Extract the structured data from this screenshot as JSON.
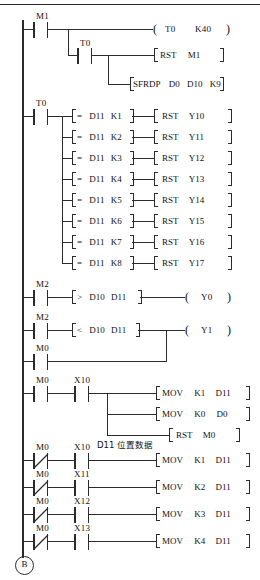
{
  "diagram": {
    "type": "plc-ladder-logic",
    "page_connector": "B",
    "comment": "D11 位置数据",
    "left_rail": true,
    "rungs": [
      {
        "id": "rung-1",
        "contacts": [
          {
            "name": "M1",
            "type": "NO"
          }
        ],
        "branches": [
          {
            "contacts": [],
            "output": {
              "kind": "coil",
              "label": "T0",
              "operand": "K40"
            }
          },
          {
            "contacts": [
              {
                "name": "T0",
                "type": "NO"
              }
            ],
            "output": {
              "kind": "box",
              "instr": "RST",
              "args": [
                "M1"
              ]
            }
          },
          {
            "contacts": [],
            "output": {
              "kind": "box",
              "instr": "SFRDP",
              "args": [
                "D0",
                "D10",
                "K9"
              ]
            }
          }
        ]
      },
      {
        "id": "rung-2",
        "contacts": [
          {
            "name": "T0",
            "type": "NO"
          }
        ],
        "branches": [
          {
            "compare": {
              "op": "=",
              "a": "D11",
              "b": "K1"
            },
            "output": {
              "kind": "box",
              "instr": "RST",
              "args": [
                "Y10"
              ]
            }
          },
          {
            "compare": {
              "op": "=",
              "a": "D11",
              "b": "K2"
            },
            "output": {
              "kind": "box",
              "instr": "RST",
              "args": [
                "Y11"
              ]
            }
          },
          {
            "compare": {
              "op": "=",
              "a": "D11",
              "b": "K3"
            },
            "output": {
              "kind": "box",
              "instr": "RST",
              "args": [
                "Y12"
              ]
            }
          },
          {
            "compare": {
              "op": "=",
              "a": "D11",
              "b": "K4"
            },
            "output": {
              "kind": "box",
              "instr": "RST",
              "args": [
                "Y13"
              ]
            }
          },
          {
            "compare": {
              "op": "=",
              "a": "D11",
              "b": "K5"
            },
            "output": {
              "kind": "box",
              "instr": "RST",
              "args": [
                "Y14"
              ]
            }
          },
          {
            "compare": {
              "op": "=",
              "a": "D11",
              "b": "K6"
            },
            "output": {
              "kind": "box",
              "instr": "RST",
              "args": [
                "Y15"
              ]
            }
          },
          {
            "compare": {
              "op": "=",
              "a": "D11",
              "b": "K7"
            },
            "output": {
              "kind": "box",
              "instr": "RST",
              "args": [
                "Y16"
              ]
            }
          },
          {
            "compare": {
              "op": "=",
              "a": "D11",
              "b": "K8"
            },
            "output": {
              "kind": "box",
              "instr": "RST",
              "args": [
                "Y17"
              ]
            }
          }
        ]
      },
      {
        "id": "rung-3",
        "contacts": [
          {
            "name": "M2",
            "type": "NO"
          }
        ],
        "compare": {
          "op": ">",
          "a": "D10",
          "b": "D11"
        },
        "output": {
          "kind": "coil",
          "label": "Y0",
          "operand": ""
        }
      },
      {
        "id": "rung-4",
        "contacts": [
          {
            "name": "M2",
            "type": "NO"
          }
        ],
        "compare": {
          "op": "<",
          "a": "D10",
          "b": "D11"
        },
        "output": {
          "kind": "coil",
          "label": "Y1",
          "operand": ""
        },
        "parallel": {
          "contacts": [
            {
              "name": "M0",
              "type": "NO"
            }
          ]
        }
      },
      {
        "id": "rung-5",
        "contacts": [
          {
            "name": "M0",
            "type": "NO"
          },
          {
            "name": "X10",
            "type": "NO"
          }
        ],
        "branches": [
          {
            "output": {
              "kind": "box",
              "instr": "MOV",
              "args": [
                "K1",
                "D11"
              ]
            }
          },
          {
            "output": {
              "kind": "box",
              "instr": "MOV",
              "args": [
                "K0",
                "D0"
              ]
            }
          },
          {
            "output": {
              "kind": "box",
              "instr": "RST",
              "args": [
                "M0"
              ]
            }
          }
        ]
      },
      {
        "id": "rung-6",
        "contacts": [
          {
            "name": "M0",
            "type": "NC"
          },
          {
            "name": "X10",
            "type": "NO"
          }
        ],
        "output": {
          "kind": "box",
          "instr": "MOV",
          "args": [
            "K1",
            "D11"
          ]
        }
      },
      {
        "id": "rung-7",
        "contacts": [
          {
            "name": "M0",
            "type": "NC"
          },
          {
            "name": "X11",
            "type": "NO"
          }
        ],
        "output": {
          "kind": "box",
          "instr": "MOV",
          "args": [
            "K2",
            "D11"
          ]
        }
      },
      {
        "id": "rung-8",
        "contacts": [
          {
            "name": "M0",
            "type": "NC"
          },
          {
            "name": "X12",
            "type": "NO"
          }
        ],
        "output": {
          "kind": "box",
          "instr": "MOV",
          "args": [
            "K3",
            "D11"
          ]
        }
      },
      {
        "id": "rung-9",
        "contacts": [
          {
            "name": "M0",
            "type": "NC"
          },
          {
            "name": "X13",
            "type": "NO"
          }
        ],
        "output": {
          "kind": "box",
          "instr": "MOV",
          "args": [
            "K4",
            "D11"
          ]
        }
      }
    ]
  },
  "labels": {
    "m1": "M1",
    "t0": "T0",
    "m2": "M2",
    "m0": "M0",
    "x10": "X10",
    "x11": "X11",
    "x12": "X12",
    "x13": "X13",
    "coil_t0": "T0",
    "coil_t0_k": "K40",
    "rst": "RST",
    "mov": "MOV",
    "sfrdp": "SFRDP",
    "y0": "Y0",
    "y1": "Y1",
    "y10": "Y10",
    "y11": "Y11",
    "y12": "Y12",
    "y13": "Y13",
    "y14": "Y14",
    "y15": "Y15",
    "y16": "Y16",
    "y17": "Y17",
    "d0": "D0",
    "d10": "D10",
    "d11": "D11",
    "k9": "K9",
    "k0": "K0",
    "k1": "K1",
    "k2": "K2",
    "k3": "K3",
    "k4": "K4",
    "k5": "K5",
    "k6": "K6",
    "k7": "K7",
    "k8": "K8",
    "eq": "=",
    "gt": ">",
    "lt": "<",
    "comment": "D11 位置数据",
    "connector_b": "B"
  }
}
